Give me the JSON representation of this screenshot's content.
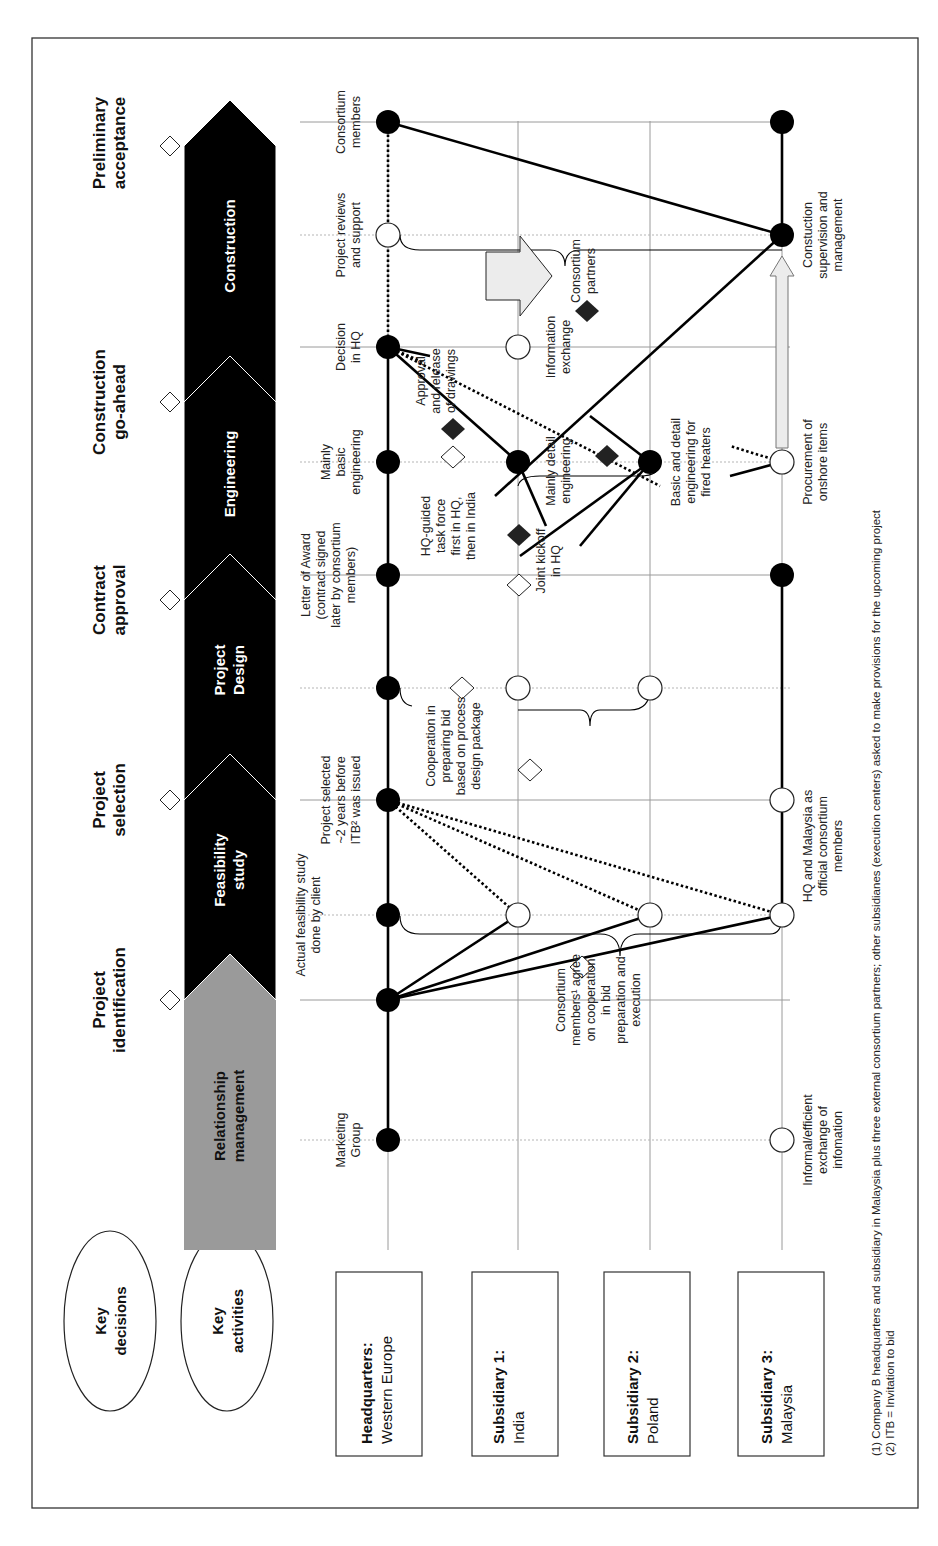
{
  "key_ovals": {
    "decisions": [
      "Key",
      "decisions"
    ],
    "activities": [
      "Key",
      "activities"
    ]
  },
  "key_decisions": [
    {
      "label": [
        "Project",
        "identification"
      ]
    },
    {
      "label": [
        "Project",
        "selection"
      ]
    },
    {
      "label": [
        "Contract",
        "approval"
      ]
    },
    {
      "label": [
        "Construction",
        "go-ahead"
      ]
    },
    {
      "label": [
        "Preliminary",
        "acceptance"
      ]
    }
  ],
  "phases": [
    {
      "label": [
        "Relationship",
        "management"
      ],
      "color": "#9a9a9a"
    },
    {
      "label": [
        "Feasibility",
        "study"
      ],
      "color": "#000000"
    },
    {
      "label": [
        "Project",
        "Design"
      ],
      "color": "#000000"
    },
    {
      "label": [
        "Engineering"
      ],
      "color": "#000000"
    },
    {
      "label": [
        "Construction"
      ],
      "color": "#000000"
    }
  ],
  "lanes": [
    {
      "title": "Headquarters:",
      "subtitle": "Western Europe"
    },
    {
      "title": "Subsidiary 1:",
      "subtitle": "India"
    },
    {
      "title": "Subsidiary 2:",
      "subtitle": "Poland"
    },
    {
      "title": "Subsidiary 3:",
      "subtitle": "Malaysia"
    }
  ],
  "annotations": {
    "marketing_group": [
      "Marketing",
      "Group"
    ],
    "feasibility_by_client": [
      "Actual feasibility study",
      "done by client"
    ],
    "project_selected": [
      "Project selected",
      "~2 years before",
      "ITB² was issued"
    ],
    "letter_of_award": [
      "Letter of Award",
      "(contract signed",
      "later by consortium",
      "members)"
    ],
    "mainly_basic": [
      "Mainly",
      "basic",
      "engineering"
    ],
    "decision_hq": [
      "Decision",
      "in HQ"
    ],
    "project_reviews": [
      "Project reviews",
      "and support"
    ],
    "consortium_members_top": [
      "Consortium",
      "members"
    ],
    "consortium_agree": [
      "Consortium",
      "members¹ agree",
      "on cooperation",
      "in bid",
      "preparation and",
      "execution"
    ],
    "cooperation_bid": [
      "Cooperation in",
      "preparing bid",
      "based on process",
      "design package"
    ],
    "hq_task_force": [
      "HQ-guided",
      "task force",
      "first in HQ,",
      "then in India"
    ],
    "joint_kickoff": [
      "Joint kickoff",
      "in HQ"
    ],
    "mainly_detail": [
      "Mainly detail",
      "engineering"
    ],
    "approval_release": [
      "Approval",
      "and release",
      "of drawings"
    ],
    "information_exchange": [
      "Information",
      "exchange"
    ],
    "consortium_partners": [
      "Consortium",
      "partners"
    ],
    "basic_detail_heaters": [
      "Basic and detail",
      "engineering for",
      "fired heaters"
    ],
    "informal_exchange": [
      "Informal/efficient",
      "exchange of",
      "infomation"
    ],
    "hq_malaysia_official": [
      "HQ and Malaysia as",
      "official consortium",
      "members"
    ],
    "procurement": [
      "Procurement of",
      "onshore items"
    ],
    "construction_supervision": [
      "Constuction",
      "supervision and",
      "management"
    ]
  },
  "footnotes": [
    "(1) Company B headquarters and subsidiary in Malaysia plus three external consortium partners; other subsidianes (execution centers) asked to make provisions for the upcoming project",
    "(2) ITB = Invitation to bid"
  ],
  "colors": {
    "phase_dark": "#000000",
    "phase_relationship": "#9a9a9a",
    "grid": "#9a9a9a",
    "arrow_fill": "#ececec"
  }
}
